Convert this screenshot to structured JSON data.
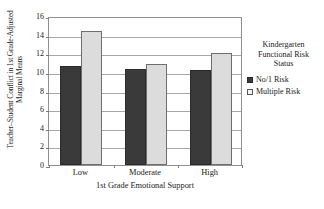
{
  "chart_data": {
    "type": "bar",
    "title": "",
    "xlabel": "1st Grade Emotional Support",
    "ylabel": "Teacher–Student Conflict in 1st Grade-Adjusted Marginal Means",
    "categories": [
      "Low",
      "Moderate",
      "High"
    ],
    "series": [
      {
        "name": "No/1 Risk",
        "values": [
          10.6,
          10.3,
          10.2
        ],
        "color": "#3a3a3a"
      },
      {
        "name": "Multiple Risk",
        "values": [
          14.4,
          10.9,
          12.0
        ],
        "color": "#dcdcdc"
      }
    ],
    "ylim": [
      0,
      16
    ],
    "yticks": [
      0,
      2,
      4,
      6,
      8,
      10,
      12,
      14,
      16
    ],
    "ytick_labels": [
      "0",
      "2",
      "4",
      "6",
      "8",
      "10",
      "12",
      "14",
      "16"
    ],
    "grid": true,
    "legend_position": "right"
  },
  "legend": {
    "title_lines": [
      "Kindergarten",
      "Functional Risk",
      "Status"
    ],
    "entries": [
      {
        "label": "No/1 Risk",
        "swatch": "dark-square-swatch"
      },
      {
        "label": "Multiple Risk",
        "swatch": "light-square-swatch"
      }
    ]
  },
  "axes": {
    "y_title": "Teacher–Student Conflict in 1st Grade-Adjusted Marginal Means",
    "x_title": "1st Grade Emotional Support"
  }
}
